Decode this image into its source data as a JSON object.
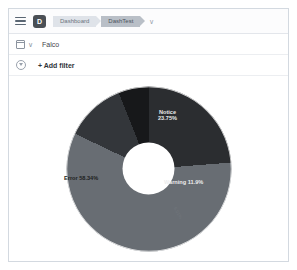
{
  "topnav": {
    "menu_icon": "hamburger-icon",
    "app_logo_letter": "D",
    "breadcrumbs": [
      {
        "label": "Dashboard",
        "active": false
      },
      {
        "label": "DashTest",
        "active": true
      }
    ],
    "caret": "∨"
  },
  "querybar": {
    "calendar_icon": "calendar-icon",
    "caret": "∨",
    "query_text": "Falco"
  },
  "filterbar": {
    "filter_icon": "funnel-icon",
    "add_filter_label": "+ Add filter"
  },
  "chart_data": {
    "type": "pie",
    "variant": "donut",
    "title": "",
    "labels": [
      "Notice",
      "Error",
      "Warning",
      "Informational"
    ],
    "values": [
      23.75,
      58.34,
      11.9,
      6.01
    ],
    "value_suffix": "%",
    "data_labels": [
      "Notice\n23.75%",
      "Error 58.34%",
      "Warning 11.9%",
      "6.01%"
    ],
    "colors": [
      "#2b2d30",
      "#686d73",
      "#33363a",
      "#17181a"
    ],
    "legend": "none",
    "grid": false,
    "start_angle": 0,
    "donut_hole_ratio": 0.32,
    "series": [
      {
        "name": "Count percentage",
        "values": [
          23.75,
          58.34,
          11.9,
          6.01
        ]
      }
    ]
  },
  "labels": {
    "notice": "Notice\n23.75%",
    "notice_name": "Notice",
    "notice_value": "23.75%",
    "error": "Error 58.34%",
    "warning": "Warning 11.9%",
    "small": "6.01%"
  }
}
